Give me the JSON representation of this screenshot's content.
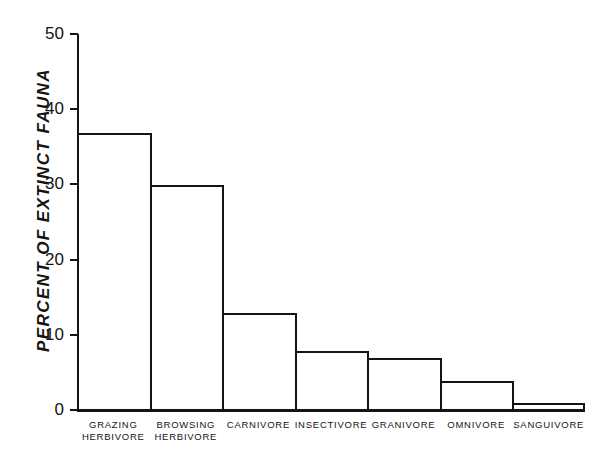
{
  "chart_data": {
    "type": "bar",
    "title": "",
    "xlabel": "",
    "ylabel": "PERCENT OF EXTINCT FAUNA",
    "ylim": [
      0,
      50
    ],
    "yticks": [
      0,
      10,
      20,
      30,
      40,
      50
    ],
    "ytick_labels": [
      "0",
      "10",
      "20",
      "30",
      "40",
      "50"
    ],
    "grid": false,
    "legend": null,
    "bar_style": "outlined, unfilled, adjacent bars sharing edges",
    "categories": [
      "GRAZING HERBIVORE",
      "BROWSING HERBIVORE",
      "CARNIVORE",
      "INSECTIVORE",
      "GRANIVORE",
      "OMNIVORE",
      "SANGUIVORE"
    ],
    "category_label_lines": [
      [
        "GRAZING",
        "HERBIVORE"
      ],
      [
        "BROWSING",
        "HERBIVORE"
      ],
      [
        "CARNIVORE"
      ],
      [
        "INSECTIVORE"
      ],
      [
        "GRANIVORE"
      ],
      [
        "OMNIVORE"
      ],
      [
        "SANGUIVORE"
      ]
    ],
    "values": [
      37,
      30,
      13,
      8,
      7,
      4,
      1
    ]
  },
  "colors": {
    "background": "#ffffff",
    "ink": "#141414",
    "bar_fill": "#ffffff",
    "bar_stroke": "#141414"
  }
}
